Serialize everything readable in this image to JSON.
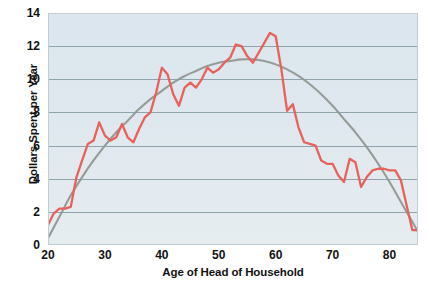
{
  "chart_data": {
    "type": "line",
    "title": "",
    "xlabel": "Age of Head of Household",
    "ylabel": "Dollars Spent per Year",
    "xlim": [
      20,
      85
    ],
    "ylim": [
      0,
      14
    ],
    "xticks": [
      20,
      30,
      40,
      50,
      60,
      70,
      80
    ],
    "yticks": [
      0,
      2,
      4,
      6,
      8,
      10,
      12,
      14
    ],
    "grid": "horizontal",
    "legend": "none",
    "plot_background": "#dee7ee",
    "gridline_color": "#8fa3ad",
    "series": [
      {
        "name": "Observed spending",
        "color": "#e8615a",
        "style": "jagged-line",
        "x": [
          20,
          21,
          22,
          23,
          24,
          25,
          26,
          27,
          28,
          29,
          30,
          31,
          32,
          33,
          34,
          35,
          36,
          37,
          38,
          39,
          40,
          41,
          42,
          43,
          44,
          45,
          46,
          47,
          48,
          49,
          50,
          51,
          52,
          53,
          54,
          55,
          56,
          57,
          58,
          59,
          60,
          61,
          62,
          63,
          64,
          65,
          66,
          67,
          68,
          69,
          70,
          71,
          72,
          73,
          74,
          75,
          76,
          77,
          78,
          79,
          80,
          81,
          82,
          83,
          84,
          85
        ],
        "values": [
          1.2,
          1.9,
          2.2,
          2.2,
          2.3,
          4.1,
          5.1,
          6.1,
          6.3,
          7.4,
          6.6,
          6.3,
          6.5,
          7.3,
          6.5,
          6.2,
          7.0,
          7.7,
          8.0,
          9.2,
          10.7,
          10.3,
          9.1,
          8.4,
          9.5,
          9.8,
          9.5,
          10.0,
          10.7,
          10.4,
          10.6,
          11.0,
          11.3,
          12.1,
          12.0,
          11.4,
          11.0,
          11.6,
          12.2,
          12.8,
          12.6,
          10.6,
          8.1,
          8.5,
          7.1,
          6.2,
          6.1,
          6.0,
          5.1,
          4.9,
          4.9,
          4.2,
          3.8,
          5.2,
          5.0,
          3.5,
          4.1,
          4.5,
          4.6,
          4.6,
          4.5,
          4.5,
          3.9,
          2.4,
          0.9,
          0.9
        ]
      },
      {
        "name": "Fitted trend",
        "color": "#969b98",
        "style": "smooth-curve",
        "x": [
          20,
          22,
          24,
          26,
          28,
          30,
          32,
          34,
          36,
          38,
          40,
          42,
          44,
          46,
          48,
          50,
          52,
          54,
          56,
          58,
          60,
          62,
          64,
          66,
          68,
          70,
          72,
          74,
          76,
          78,
          80,
          82,
          84,
          85
        ],
        "values": [
          0.4,
          1.7,
          3.0,
          4.1,
          5.1,
          6.0,
          6.8,
          7.5,
          8.2,
          8.8,
          9.3,
          9.8,
          10.2,
          10.5,
          10.8,
          11.0,
          11.1,
          11.2,
          11.2,
          11.1,
          10.9,
          10.6,
          10.2,
          9.7,
          9.1,
          8.4,
          7.6,
          6.8,
          5.9,
          4.9,
          3.8,
          2.6,
          1.4,
          0.8
        ]
      }
    ]
  }
}
